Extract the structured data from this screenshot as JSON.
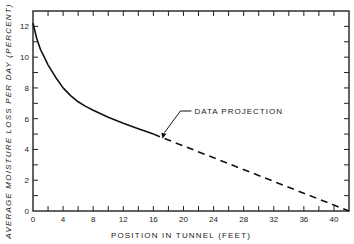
{
  "chart_data": {
    "type": "line",
    "title": "",
    "xlabel": "POSITION IN TUNNEL (FEET)",
    "ylabel": "AVERAGE MOISTURE LOSS PER DAY (PERCENT)",
    "xlim": [
      0,
      42
    ],
    "ylim": [
      0,
      13
    ],
    "x_ticks": [
      0,
      4,
      8,
      12,
      16,
      20,
      24,
      28,
      32,
      36,
      40
    ],
    "y_ticks": [
      0,
      2,
      4,
      6,
      8,
      10,
      12
    ],
    "grid": false,
    "series": [
      {
        "name": "Measured",
        "style": "solid",
        "x": [
          0,
          0.5,
          1,
          1.5,
          2,
          3,
          4,
          5,
          6,
          7,
          8,
          10,
          12,
          14,
          16
        ],
        "y": [
          12.2,
          11.2,
          10.5,
          10.0,
          9.5,
          8.7,
          8.0,
          7.5,
          7.1,
          6.8,
          6.55,
          6.1,
          5.7,
          5.35,
          5.0
        ]
      },
      {
        "name": "Data projection",
        "style": "dashed",
        "x": [
          16,
          42
        ],
        "y": [
          5.0,
          0
        ]
      }
    ],
    "annotations": [
      {
        "text": "DATA PROJECTION",
        "x": 18,
        "y": 6.5,
        "arrow_to": {
          "x": 17.2,
          "y": 4.7
        }
      }
    ]
  }
}
